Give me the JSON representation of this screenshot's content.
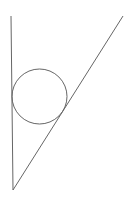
{
  "diagram": {
    "type": "geometry",
    "stroke_color": "#666666",
    "background": "#ffffff",
    "vertex": {
      "x": 13,
      "y": 190
    },
    "left_line": {
      "x1": 11,
      "y1": 16,
      "x2": 13,
      "y2": 190
    },
    "right_line": {
      "x1": 123,
      "y1": 16,
      "x2": 13,
      "y2": 190
    },
    "circle": {
      "cx": 39.5,
      "cy": 96.5,
      "r": 27.5
    }
  }
}
